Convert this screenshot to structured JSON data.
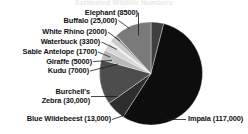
{
  "page": {
    "background_color": "#ffffff",
    "cut_off_title": "Estimated Wildlife Numbers"
  },
  "chart_data": {
    "type": "pie",
    "title": "",
    "subtitle": "",
    "xlabel": "",
    "ylabel": "",
    "legend_position": "none",
    "grid": false,
    "label_format": "name (count)",
    "total": 201500,
    "categories": [
      "Elephant",
      "Impala",
      "Blue Wildebeest",
      "Burchell's Zebra",
      "Kudu",
      "Giraffe",
      "Sable Antelope",
      "Waterbuck",
      "White Rhino",
      "Buffalo"
    ],
    "values": [
      8500,
      117000,
      13000,
      30000,
      7000,
      5000,
      1700,
      3300,
      2000,
      25000
    ],
    "value_labels": [
      "8500",
      "117,000",
      "13,000",
      "30,000",
      "7000",
      "5000",
      "1700",
      "3300",
      "2000",
      "25,000"
    ],
    "slice_colors": [
      "#3f3f3f",
      "#0d0d0d",
      "#2e2e2e",
      "#4d4d4d",
      "#b9b9b9",
      "#d6d6d6",
      "#ededed",
      "#c9c9c9",
      "#9a9a9a",
      "#7a7a7a"
    ],
    "slices": [
      {
        "name": "Elephant",
        "label": "Elephant (8500)",
        "value": 8500,
        "color": "#3f3f3f"
      },
      {
        "name": "Impala",
        "label": "Impala (117,000)",
        "value": 117000,
        "color": "#0d0d0d"
      },
      {
        "name": "Blue Wildebeest",
        "label": "Blue Wildebeest (13,000)",
        "value": 13000,
        "color": "#2e2e2e"
      },
      {
        "name": "Burchell's Zebra",
        "label": "Burchell's\nZebra (30,000)",
        "value": 30000,
        "color": "#4d4d4d"
      },
      {
        "name": "Kudu",
        "label": "Kudu (7000)",
        "value": 7000,
        "color": "#b9b9b9"
      },
      {
        "name": "Giraffe",
        "label": "Giraffe (5000)",
        "value": 5000,
        "color": "#d6d6d6"
      },
      {
        "name": "Sable Antelope",
        "label": "Sable Antelope (1700)",
        "value": 1700,
        "color": "#ededed"
      },
      {
        "name": "Waterbuck",
        "label": "Waterbuck (3300)",
        "value": 3300,
        "color": "#c9c9c9"
      },
      {
        "name": "White Rhino",
        "label": "White Rhino (2000)",
        "value": 2000,
        "color": "#9a9a9a"
      },
      {
        "name": "Buffalo",
        "label": "Buffalo (25,000)",
        "value": 25000,
        "color": "#7a7a7a"
      }
    ]
  },
  "labels": {
    "elephant": "Elephant (8500)",
    "buffalo": "Buffalo (25,000)",
    "white_rhino": "White Rhino (2000)",
    "waterbuck": "Waterbuck (3300)",
    "sable_antelope": "Sable Antelope (1700)",
    "giraffe": "Giraffe (5000)",
    "kudu": "Kudu (7000)",
    "zebra_line1": "Burchell's",
    "zebra_line2": "Zebra (30,000)",
    "blue_wildebeest": "Blue Wildebeest (13,000)",
    "impala": "Impala (117,000)"
  }
}
